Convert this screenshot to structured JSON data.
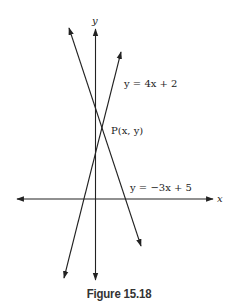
{
  "figure": {
    "caption": "Figure 15.18",
    "axes": {
      "x_label": "x",
      "y_label": "y"
    },
    "lines": [
      {
        "name": "line-4x-plus-2",
        "equation": "y = 4x + 2"
      },
      {
        "name": "line-neg3x-plus-5",
        "equation": "y = −3x + 5"
      }
    ],
    "point": {
      "label": "P(x, y)"
    },
    "colors": {
      "stroke": "#222222",
      "background": "#ffffff"
    }
  }
}
